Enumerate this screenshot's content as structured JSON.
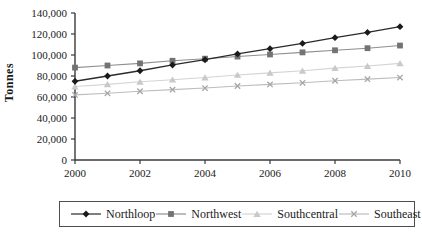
{
  "figure": {
    "background": "#ffffff",
    "axis_color": "#3a3a3a",
    "text_color": "#1a1a1a"
  },
  "chart_data": {
    "type": "line",
    "title": "",
    "xlabel": "",
    "ylabel": "Tonnes",
    "x": [
      2000,
      2001,
      2002,
      2003,
      2004,
      2005,
      2006,
      2007,
      2008,
      2009,
      2010
    ],
    "xtick_labels": [
      "2000",
      "2002",
      "2004",
      "2006",
      "2008",
      "2010"
    ],
    "xticks": [
      2000,
      2002,
      2004,
      2006,
      2008,
      2010
    ],
    "ylim": [
      0,
      140000
    ],
    "ytick_step": 20000,
    "ytick_labels": [
      "0",
      "20,000",
      "40,000",
      "60,000",
      "80,000",
      "100,000",
      "120,000",
      "140,000"
    ],
    "grid": false,
    "legend_position": "bottom",
    "series": [
      {
        "name": "Northloop",
        "marker": "diamond",
        "marker_color": "#1a1a1a",
        "line_color": "#2a2a2a",
        "values": [
          75000,
          80000,
          85000,
          90500,
          95500,
          101000,
          106000,
          111000,
          116500,
          121500,
          127000
        ]
      },
      {
        "name": "Northwest",
        "marker": "square",
        "marker_color": "#737373",
        "line_color": "#8f8f8f",
        "values": [
          88000,
          90000,
          92000,
          94500,
          96500,
          98500,
          100500,
          102500,
          104500,
          106500,
          109000
        ]
      },
      {
        "name": "Southcentral",
        "marker": "triangle",
        "marker_color": "#c9c9c9",
        "line_color": "#d4d4d4",
        "values": [
          70000,
          72000,
          74500,
          76500,
          78500,
          81000,
          83000,
          85000,
          87500,
          89500,
          92000
        ]
      },
      {
        "name": "Southeast",
        "marker": "x",
        "marker_color": "#a6a6a6",
        "line_color": "#bdbdbd",
        "values": [
          62000,
          63500,
          65500,
          67000,
          68500,
          70500,
          72000,
          73500,
          75500,
          77000,
          78500
        ]
      }
    ]
  }
}
